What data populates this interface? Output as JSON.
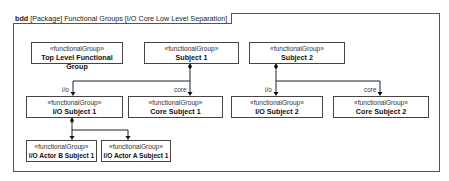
{
  "diagram": {
    "frame_kind": "bdd",
    "frame_title": "[Package] Functional Groups [I/O Core Low Level Separation]",
    "blocks": [
      {
        "id": "top-level",
        "stereotype": "«functionalGroup»",
        "name": "Top Level Functional Group"
      },
      {
        "id": "subject-1",
        "stereotype": "«functionalGroup»",
        "name": "Subject 1"
      },
      {
        "id": "subject-2",
        "stereotype": "«functionalGroup»",
        "name": "Subject 2"
      },
      {
        "id": "io-subject-1",
        "stereotype": "«functionalGroup»",
        "name": "I/O Subject 1"
      },
      {
        "id": "core-subject-1",
        "stereotype": "«functionalGroup»",
        "name": "Core Subject 1"
      },
      {
        "id": "io-subject-2",
        "stereotype": "«functionalGroup»",
        "name": "I/O Subject 2"
      },
      {
        "id": "core-subject-2",
        "stereotype": "«functionalGroup»",
        "name": "Core Subject 2"
      },
      {
        "id": "io-actor-b-subject-1",
        "stereotype": "«functionalGroup»",
        "name": "I/O Actor B Subject 1"
      },
      {
        "id": "io-actor-a-subject-1",
        "stereotype": "«functionalGroup»",
        "name": "I/O Actor A Subject 1"
      }
    ],
    "roles": {
      "s1_io": "i/o",
      "s1_core": "core",
      "s2_io": "i/o",
      "s2_core": "core"
    },
    "relationships": [
      {
        "type": "composition",
        "from": "Subject 1",
        "to": "I/O Subject 1",
        "role": "i/o"
      },
      {
        "type": "composition",
        "from": "Subject 1",
        "to": "Core Subject 1",
        "role": "core"
      },
      {
        "type": "composition",
        "from": "Subject 2",
        "to": "I/O Subject 2",
        "role": "i/o"
      },
      {
        "type": "composition",
        "from": "Subject 2",
        "to": "Core Subject 2",
        "role": "core"
      },
      {
        "type": "composition",
        "from": "I/O Subject 1",
        "to": "I/O Actor B Subject 1",
        "role": ""
      },
      {
        "type": "composition",
        "from": "I/O Subject 1",
        "to": "I/O Actor A Subject 1",
        "role": ""
      }
    ]
  }
}
